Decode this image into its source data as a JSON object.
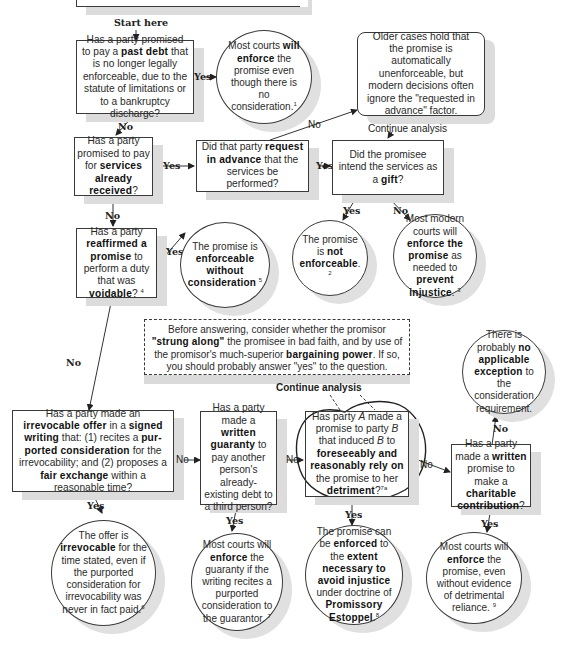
{
  "diagram": {
    "start_label": "Start here",
    "top_banner": "",
    "nodes": {
      "q_past_debt": {
        "pre": "Has a party promised to pay a ",
        "bold": "past debt",
        "post": " that is no longer legally enforceable, due to the statute of limitations or to a bankruptcy discharge?"
      },
      "r_past_debt": {
        "pre": "Most courts ",
        "bold": "will enforce",
        "post": " the promise even though there is no consideration.",
        "note": "1"
      },
      "r_older_cases": {
        "text": "Older cases hold that the promise is automatically unenforceable, but modern decisions often ignore the \"requested in advance\" factor."
      },
      "q_services": {
        "pre": "Has a party promised to pay for ",
        "bold": "services already received",
        "post": "?"
      },
      "q_request": {
        "pre": "Did that party ",
        "bold": "request in advance",
        "post": " that the services be performed?"
      },
      "q_gift": {
        "pre": "Did the promisee intend the services as a ",
        "bold": "gift",
        "post": "?"
      },
      "r_not_enforceable": {
        "pre": "The promise is ",
        "bold": "not enforceable",
        "post": ".",
        "note": "2"
      },
      "r_prevent_injustice": {
        "pre": "Most modern courts will ",
        "bold1": "enforce the promise",
        "mid": " as needed to ",
        "bold2": "prevent injustice",
        "post": ".",
        "note": "3"
      },
      "q_reaffirmed": {
        "pre": "Has a party ",
        "bold1": "reaffirmed a promise",
        "mid": " to perform a duty that was ",
        "bold2": "voidable",
        "post": "?",
        "note": "4"
      },
      "r_without_consideration": {
        "pre": "The promise is ",
        "bold": "enforceable without consideration",
        "note": "5"
      },
      "note_strung_along": {
        "p1": "Before answering, consider whether the promisor ",
        "b1": "\"strung along\"",
        "p2": " the promisee in bad faith, and by use of the promisor's much-superior ",
        "b2": "bargaining power",
        "p3": ". If so, you should probably answer \"yes\" to the question."
      },
      "r_no_exception": {
        "pre": "There is probably ",
        "bold": "no applicable exception",
        "post": " to the consideration requirement."
      },
      "q_irrevocable": {
        "p1": "Has a party made an ",
        "b1": "irrevocable offer",
        "p2": " in a ",
        "b2": "signed writing",
        "p3": " that: (1) recites a ",
        "b3": "pur-ported consideration",
        "p4": " for the irrevocability; and (2) proposes a ",
        "b4": "fair exchange",
        "p5": " within a reasonable time?"
      },
      "q_guaranty": {
        "pre": "Has a party made a ",
        "bold": "written guaranty",
        "post": " to pay another person's already-existing debt to a third person?"
      },
      "q_reliance": {
        "p1": "Has party ",
        "i1": "A",
        "p2": " made a promise to party ",
        "i2": "B",
        "p3": " that induced ",
        "i3": "B",
        "p4": " to ",
        "b1": "foreseeably and reasonably rely on",
        "p5": " the promise to her ",
        "b2": "detriment",
        "p6": "?",
        "note": "7a"
      },
      "q_charitable": {
        "pre": "Has a party made a ",
        "bold1": "written",
        "mid": " promise to make a ",
        "bold2": "charitable contribution",
        "post": "?"
      },
      "r_irrevocable": {
        "pre": "The offer is ",
        "bold": "irrevocable",
        "post": " for the time stated, even if the purported consideration for irrevocability was never in fact paid.",
        "note": "6"
      },
      "r_guaranty": {
        "pre": "Most courts will ",
        "bold": "enforce",
        "post": " the guaranty if the writing recites a purported consideration to the guarantor.",
        "note": "7"
      },
      "r_estoppel": {
        "p1": "The promise can be ",
        "b1": "enforced",
        "p2": " to the ",
        "b2": "extent necessary to avoid injustice",
        "p3": " under doctrine of ",
        "b3": "Promissory Estoppel",
        "p4": ".",
        "note": "8"
      },
      "r_charitable": {
        "pre": "Most courts will ",
        "bold": "enforce",
        "post": " the promise, even without evidence of detrimental reliance.",
        "note": "9"
      }
    },
    "edge_labels": {
      "yes": "Yes",
      "no": "No",
      "continue": "Continue analysis"
    }
  }
}
